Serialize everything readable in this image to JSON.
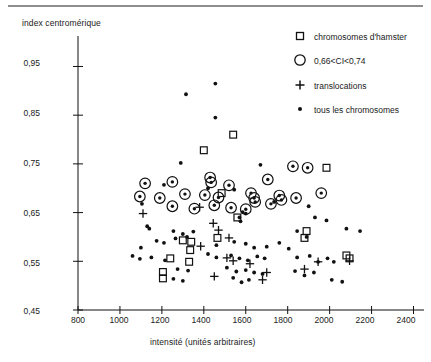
{
  "figure": {
    "axes": {
      "y_label": "index centromérique",
      "x_label": "intensité (unités arbitraires)",
      "y_ticks": [
        "0,95",
        "0,85",
        "0,75",
        "0,65",
        "0,55",
        "0,45"
      ],
      "x_ticks": [
        "800",
        "1000",
        "1200",
        "1400",
        "1600",
        "1800",
        "2000",
        "2200",
        "2400"
      ]
    },
    "legend": {
      "items": [
        {
          "marker": "open-square",
          "label": "chromosomes d'hamster"
        },
        {
          "marker": "large-open-circle",
          "label": "0,66<CI<0,74"
        },
        {
          "marker": "plus",
          "label": "translocations"
        },
        {
          "marker": "small-filled-dot",
          "label": "tous les chromosomes"
        }
      ]
    },
    "colors": {
      "ink": "#111111",
      "rule": "#8e8e8e",
      "background": "#ffffff"
    }
  },
  "chart_data": {
    "type": "scatter",
    "title": "",
    "xlabel": "intensité (unités arbitraires)",
    "ylabel": "index centromérique",
    "xlim": [
      800,
      2450
    ],
    "ylim": [
      0.45,
      0.99
    ],
    "xticks": [
      800,
      1000,
      1200,
      1400,
      1600,
      1800,
      2000,
      2200,
      2400
    ],
    "yticks": [
      0.45,
      0.55,
      0.65,
      0.75,
      0.85,
      0.95
    ],
    "grid": false,
    "legend_position": "upper-right-outside",
    "series": [
      {
        "name": "tous les chromosomes",
        "marker": "small-filled-dot",
        "points": [
          [
            1455,
            0.915
          ],
          [
            1315,
            0.893
          ],
          [
            1455,
            0.845
          ],
          [
            1290,
            0.752
          ],
          [
            1670,
            0.748
          ],
          [
            1210,
            0.707
          ],
          [
            1420,
            0.7
          ],
          [
            1545,
            0.697
          ],
          [
            1105,
            0.668
          ],
          [
            1735,
            0.672
          ],
          [
            1900,
            0.663
          ],
          [
            1585,
            0.651
          ],
          [
            1600,
            0.648
          ],
          [
            1570,
            0.64
          ],
          [
            1575,
            0.632
          ],
          [
            1930,
            0.64
          ],
          [
            1985,
            0.634
          ],
          [
            1130,
            0.622
          ],
          [
            1140,
            0.617
          ],
          [
            1255,
            0.612
          ],
          [
            1300,
            0.606
          ],
          [
            1350,
            0.611
          ],
          [
            1265,
            0.597
          ],
          [
            1320,
            0.6
          ],
          [
            1175,
            0.592
          ],
          [
            1210,
            0.588
          ],
          [
            1845,
            0.612
          ],
          [
            1890,
            0.6
          ],
          [
            2080,
            0.617
          ],
          [
            2145,
            0.612
          ],
          [
            1100,
            0.578
          ],
          [
            1460,
            0.583
          ],
          [
            1545,
            0.59
          ],
          [
            1600,
            0.586
          ],
          [
            1640,
            0.578
          ],
          [
            1700,
            0.58
          ],
          [
            1760,
            0.588
          ],
          [
            1805,
            0.576
          ],
          [
            1060,
            0.561
          ],
          [
            1095,
            0.555
          ],
          [
            1150,
            0.558
          ],
          [
            1215,
            0.552
          ],
          [
            1420,
            0.565
          ],
          [
            1460,
            0.558
          ],
          [
            1530,
            0.562
          ],
          [
            1570,
            0.556
          ],
          [
            1610,
            0.552
          ],
          [
            1655,
            0.56
          ],
          [
            1690,
            0.556
          ],
          [
            1845,
            0.558
          ],
          [
            1905,
            0.561
          ],
          [
            1945,
            0.549
          ],
          [
            1990,
            0.556
          ],
          [
            2020,
            0.549
          ],
          [
            1275,
            0.534
          ],
          [
            1325,
            0.531
          ],
          [
            1510,
            0.537
          ],
          [
            1555,
            0.529
          ],
          [
            1600,
            0.532
          ],
          [
            1640,
            0.527
          ],
          [
            1680,
            0.524
          ],
          [
            1835,
            0.53
          ],
          [
            1880,
            0.521
          ],
          [
            1925,
            0.527
          ],
          [
            1255,
            0.514
          ],
          [
            1300,
            0.51
          ],
          [
            1540,
            0.516
          ],
          [
            1580,
            0.507
          ],
          [
            1615,
            0.512
          ],
          [
            2010,
            0.512
          ],
          [
            2060,
            0.508
          ]
        ]
      },
      {
        "name": "0,66<CI<0,74",
        "marker": "large-open-circle",
        "points": [
          [
            1120,
            0.71
          ],
          [
            1250,
            0.713
          ],
          [
            1430,
            0.722
          ],
          [
            1435,
            0.712
          ],
          [
            1520,
            0.706
          ],
          [
            1705,
            0.718
          ],
          [
            1825,
            0.745
          ],
          [
            1895,
            0.742
          ],
          [
            1095,
            0.683
          ],
          [
            1190,
            0.68
          ],
          [
            1310,
            0.688
          ],
          [
            1405,
            0.686
          ],
          [
            1470,
            0.681
          ],
          [
            1625,
            0.69
          ],
          [
            1640,
            0.68
          ],
          [
            1645,
            0.672
          ],
          [
            1760,
            0.685
          ],
          [
            1770,
            0.676
          ],
          [
            1960,
            0.69
          ],
          [
            1250,
            0.663
          ],
          [
            1355,
            0.658
          ],
          [
            1450,
            0.665
          ],
          [
            1530,
            0.66
          ],
          [
            1600,
            0.657
          ],
          [
            1720,
            0.668
          ],
          [
            1840,
            0.68
          ]
        ]
      },
      {
        "name": "chromosomes d'hamster",
        "marker": "open-square",
        "points": [
          [
            1540,
            0.81
          ],
          [
            1400,
            0.778
          ],
          [
            1985,
            0.742
          ],
          [
            1485,
            0.69
          ],
          [
            1560,
            0.64
          ],
          [
            1300,
            0.593
          ],
          [
            1340,
            0.59
          ],
          [
            1465,
            0.598
          ],
          [
            1880,
            0.598
          ],
          [
            1335,
            0.573
          ],
          [
            1240,
            0.556
          ],
          [
            1330,
            0.549
          ],
          [
            1890,
            0.612
          ],
          [
            2080,
            0.562
          ],
          [
            2095,
            0.556
          ],
          [
            1205,
            0.528
          ],
          [
            1205,
            0.515
          ]
        ]
      },
      {
        "name": "translocations",
        "marker": "plus",
        "points": [
          [
            1110,
            0.648
          ],
          [
            1380,
            0.661
          ],
          [
            1445,
            0.628
          ],
          [
            1470,
            0.614
          ],
          [
            1520,
            0.598
          ],
          [
            1385,
            0.581
          ],
          [
            1510,
            0.557
          ],
          [
            1540,
            0.551
          ],
          [
            1620,
            0.545
          ],
          [
            1700,
            0.527
          ],
          [
            1880,
            0.534
          ],
          [
            1945,
            0.549
          ],
          [
            2095,
            0.551
          ],
          [
            1680,
            0.512
          ],
          [
            1450,
            0.519
          ]
        ]
      }
    ]
  }
}
